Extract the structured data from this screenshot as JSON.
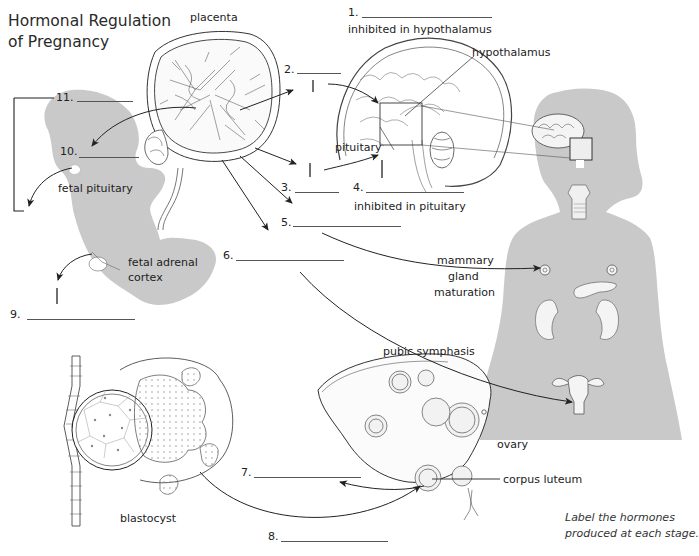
{
  "title": {
    "line1": "Hormonal Regulation",
    "line2": "of Pregnancy"
  },
  "instruction": {
    "line1": "Label the hormones",
    "line2": "produced at each stage."
  },
  "labels": {
    "placenta": "placenta",
    "hypothalamus": "hypothalamus",
    "inhibited_hypothalamus": "inhibited in hypothalamus",
    "pituitary": "pituitary",
    "inhibited_pituitary": "inhibited in pituitary",
    "fetal_pituitary": "fetal pituitary",
    "fetal_adrenal_1": "fetal adrenal",
    "fetal_adrenal_2": "cortex",
    "mammary_1": "mammary",
    "mammary_2": "gland",
    "mammary_3": "maturation",
    "pubic_symphasis": "pubic symphasis",
    "ovary": "ovary",
    "corpus_luteum": "corpus luteum",
    "blastocyst": "blastocyst"
  },
  "blanks": [
    {
      "number": "1.",
      "value": ""
    },
    {
      "number": "2.",
      "value": ""
    },
    {
      "number": "3.",
      "value": ""
    },
    {
      "number": "4.",
      "value": ""
    },
    {
      "number": "5.",
      "value": ""
    },
    {
      "number": "6.",
      "value": ""
    },
    {
      "number": "7.",
      "value": ""
    },
    {
      "number": "8.",
      "value": ""
    },
    {
      "number": "9.",
      "value": ""
    },
    {
      "number": "10.",
      "value": ""
    },
    {
      "number": "11.",
      "value": ""
    }
  ],
  "colors": {
    "silhouette": "#c9c9c9",
    "line": "#222222",
    "blank_line": "#555555"
  }
}
